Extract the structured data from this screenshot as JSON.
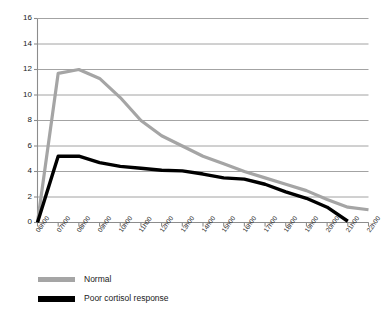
{
  "chart_data": {
    "type": "line",
    "title": "",
    "subtitle": "",
    "xlabel": "",
    "ylabel": "",
    "ylim": [
      0,
      16
    ],
    "ytick_step": 2,
    "yticks": [
      0,
      2,
      4,
      6,
      8,
      10,
      12,
      14,
      16
    ],
    "grid": true,
    "grid_axis": "y",
    "legend_position": "below-left",
    "categories": [
      "06h00",
      "07h00",
      "08h00",
      "09h00",
      "10h00",
      "11h00",
      "12h00",
      "13h00",
      "14h00",
      "15h00",
      "16h00",
      "17h00",
      "18h00",
      "19h00",
      "20h00",
      "21h00",
      "22h00"
    ],
    "series": [
      {
        "name": "Normal",
        "color": "#a5a5a5",
        "values": [
          0,
          11.7,
          12.0,
          11.3,
          9.8,
          8.0,
          6.8,
          6.0,
          5.2,
          4.6,
          4.0,
          3.5,
          3.0,
          2.5,
          1.8,
          1.2,
          1.0
        ]
      },
      {
        "name": "Poor cortisol response",
        "color": "#000000",
        "values": [
          0,
          5.2,
          5.2,
          4.7,
          4.4,
          4.25,
          4.1,
          4.05,
          3.8,
          3.5,
          3.4,
          3.0,
          2.4,
          1.9,
          1.2,
          0.1,
          null
        ]
      }
    ]
  },
  "axis": {
    "color": "#8c8c8c",
    "grid_color": "#8c8c8c"
  },
  "legend": {
    "items": [
      {
        "label": "Normal",
        "color": "#a5a5a5"
      },
      {
        "label": "Poor cortisol response",
        "color": "#000000"
      }
    ]
  }
}
